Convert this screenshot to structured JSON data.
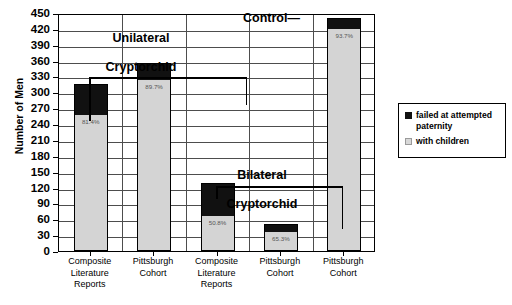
{
  "chart_data": {
    "type": "bar",
    "subtype": "stacked",
    "title": "",
    "xlabel": "",
    "ylabel": "Number of Men",
    "ylim": [
      0,
      450
    ],
    "ytick_step": 30,
    "yticks": [
      0,
      30,
      60,
      90,
      120,
      150,
      180,
      210,
      240,
      270,
      300,
      330,
      360,
      390,
      420,
      450
    ],
    "grid": true,
    "grid_axis": "y",
    "legend_position": "right",
    "categories": [
      "Composite Literature Reports",
      "Pittsburgh Cohort",
      "Composite Literature Reports",
      "Pittsburgh Cohort",
      "Pittsburgh Cohort"
    ],
    "category_lines": [
      [
        "Composite",
        "Literature",
        "Reports"
      ],
      [
        "Pittsburgh",
        "Cohort"
      ],
      [
        "Composite",
        "Literature",
        "Reports"
      ],
      [
        "Pittsburgh",
        "Cohort"
      ],
      [
        "Pittsburgh",
        "Cohort"
      ]
    ],
    "series": [
      {
        "name": "with children",
        "color": "#d4d4d4",
        "values": [
          255,
          322,
          65,
          34,
          417
        ]
      },
      {
        "name": "failed at attempted paternity",
        "color": "#111111",
        "values": [
          61,
          34,
          63,
          18,
          23
        ]
      }
    ],
    "totals": [
      316,
      356,
      128,
      52,
      440
    ],
    "data_labels": [
      "81.4%",
      "89.7%",
      "50.8%",
      "65.3%",
      "93.7%"
    ],
    "annotations": [
      {
        "name": "unilateral-group",
        "text": "Unilateral\nCryptorchid",
        "covers": [
          0,
          1
        ]
      },
      {
        "name": "bilateral-group",
        "text": "Bilateral\nCryptorchid",
        "covers": [
          2,
          3
        ]
      },
      {
        "name": "control-callout",
        "text": "Control—",
        "covers": [
          4
        ]
      }
    ]
  },
  "legend": {
    "items": [
      {
        "label": "failed at attempted paternity",
        "swatch": "failed-swatch"
      },
      {
        "label": "with children",
        "swatch": "children-swatch"
      }
    ]
  },
  "axis": {
    "y_title": "Number of Men",
    "y_labels": [
      "450",
      "420",
      "390",
      "360",
      "330",
      "300",
      "270",
      "240",
      "210",
      "180",
      "150",
      "120",
      "90",
      "60",
      "30",
      "0"
    ]
  },
  "groups": {
    "unilateral_line1": "Unilateral",
    "unilateral_line2": "Cryptorchid",
    "bilateral_line1": "Bilateral",
    "bilateral_line2": "Cryptorchid",
    "control": "Control—"
  }
}
